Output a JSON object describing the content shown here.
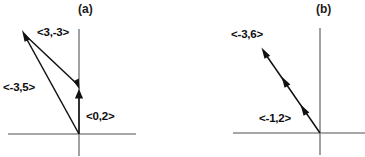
{
  "figure": {
    "background_color": "#ffffff",
    "axis_color": "#8a8a8a",
    "vector_color": "#111111",
    "text_color": "#0d0d0d"
  },
  "panels": [
    {
      "caption": "(a)",
      "axes": {
        "origin": {
          "x": 79,
          "y": 134
        },
        "x_axis": {
          "x1": 8,
          "y1": 134,
          "x2": 136,
          "y2": 134
        },
        "y_axis": {
          "x1": 79,
          "y1": 29,
          "x2": 79,
          "y2": 156
        }
      },
      "vectors": [
        {
          "label": "<3,-3>",
          "components": [
            3,
            -3
          ],
          "from": {
            "x": 22,
            "y": 31
          },
          "to": {
            "x": 79,
            "y": 88
          },
          "arrow_at": "to",
          "label_position": {
            "x": 37,
            "y": 26
          }
        },
        {
          "label": "<-3,5>",
          "components": [
            -3,
            5
          ],
          "from": {
            "x": 79,
            "y": 134
          },
          "to": {
            "x": 22,
            "y": 31
          },
          "arrow_at": "to",
          "label_position": {
            "x": 3,
            "y": 81
          }
        },
        {
          "label": "<0,2>",
          "components": [
            0,
            2
          ],
          "from": {
            "x": 79,
            "y": 134
          },
          "to": {
            "x": 79,
            "y": 88
          },
          "arrow_at": "to",
          "label_position": {
            "x": 86,
            "y": 110
          }
        }
      ]
    },
    {
      "caption": "(b)",
      "axes": {
        "origin": {
          "x": 137,
          "y": 133
        },
        "x_axis": {
          "x1": 50,
          "y1": 133,
          "x2": 182,
          "y2": 133
        },
        "y_axis": {
          "x1": 137,
          "y1": 28,
          "x2": 137,
          "y2": 155
        }
      },
      "vectors": [
        {
          "label": "<-3,6>",
          "components": [
            -3,
            6
          ],
          "from": {
            "x": 137,
            "y": 133
          },
          "to": {
            "x": 79,
            "y": 48
          },
          "arrow_at": "to",
          "label_position": {
            "x": 48,
            "y": 28
          }
        },
        {
          "label": "<-1,2>",
          "components": [
            -1,
            2
          ],
          "from": {
            "x": 137,
            "y": 133
          },
          "to": {
            "x": 118,
            "y": 105
          },
          "arrow_at": "to",
          "label_position": {
            "x": 76,
            "y": 112
          }
        },
        {
          "label": "",
          "components": [
            -1,
            2
          ],
          "from": {
            "x": 118,
            "y": 105
          },
          "to": {
            "x": 99,
            "y": 77
          },
          "arrow_at": "to",
          "label_position": null
        }
      ]
    }
  ]
}
